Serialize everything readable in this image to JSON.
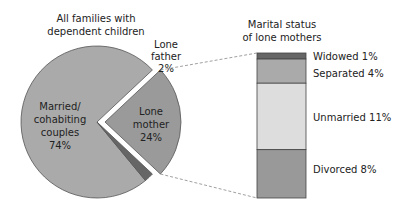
{
  "chart_data": [
    {
      "type": "pie",
      "title": [
        "All families with",
        "dependent children"
      ],
      "slices": [
        {
          "name": "married",
          "label": [
            "Married/",
            "cohabiting",
            "couples",
            "74%"
          ],
          "value": 74,
          "color": "#aaaaaa",
          "exploded": false
        },
        {
          "name": "lone-mother",
          "label": [
            "Lone",
            "mother",
            "24%"
          ],
          "value": 24,
          "color": "#9a9a9a",
          "exploded": true
        },
        {
          "name": "lone-father",
          "label": [
            "Lone",
            "father",
            "2%"
          ],
          "value": 2,
          "color": "#666666",
          "exploded": false
        }
      ]
    },
    {
      "type": "bar",
      "stacked": true,
      "title": [
        "Marital status",
        "of lone mothers"
      ],
      "segments": [
        {
          "name": "widowed",
          "label": "Widowed 1%",
          "value": 1,
          "color": "#666666"
        },
        {
          "name": "separated",
          "label": "Separated 4%",
          "value": 4,
          "color": "#aaaaaa"
        },
        {
          "name": "unmarried",
          "label": "Unmarried 11%",
          "value": 11,
          "color": "#dddddd"
        },
        {
          "name": "divorced",
          "label": "Divorced 8%",
          "value": 8,
          "color": "#999999"
        }
      ]
    }
  ]
}
